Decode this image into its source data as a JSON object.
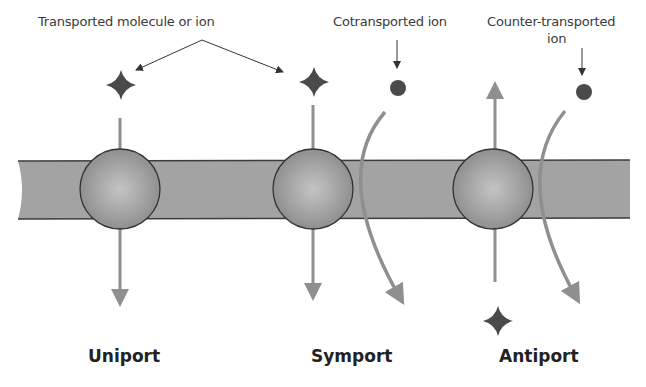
{
  "labels": {
    "transported": "Transported molecule or ion",
    "cotransported": "Cotransported ion",
    "counter_line1": "Counter-transported",
    "counter_line2": "ion"
  },
  "titles": {
    "uniport": "Uniport",
    "symport": "Symport",
    "antiport": "Antiport"
  },
  "colors": {
    "membrane": "#a3a3a3",
    "membrane_edge": "#3c3c3c",
    "protein": "#9a9a9a",
    "arrow": "#8f8f8f",
    "molecule": "#4a4a4a",
    "text": "#3a3a3a"
  },
  "icons": {
    "molecule": "four-point-star",
    "ion": "filled-circle"
  }
}
